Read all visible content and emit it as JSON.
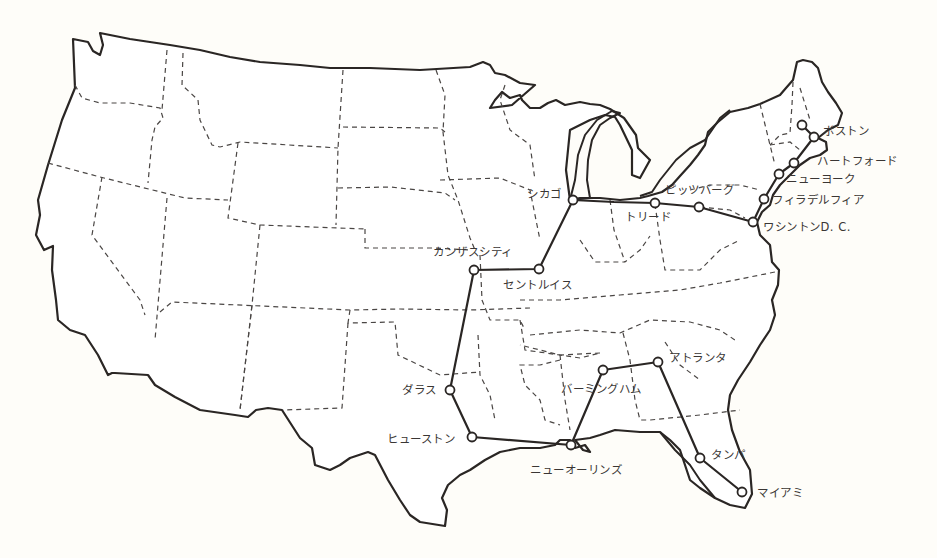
{
  "map": {
    "title": "",
    "cities": [
      {
        "id": "boston",
        "label": "ボストン",
        "x": 814,
        "y": 137
      },
      {
        "id": "boston-north",
        "label": "",
        "x": 802,
        "y": 125
      },
      {
        "id": "hartford",
        "label": "ハートフォード",
        "x": 794,
        "y": 163
      },
      {
        "id": "new-york",
        "label": "ニューヨーク",
        "x": 779,
        "y": 174
      },
      {
        "id": "philadelphia",
        "label": "フィラデルフィア",
        "x": 764,
        "y": 199
      },
      {
        "id": "washington-dc",
        "label": "ワシントンD. C.",
        "x": 753,
        "y": 222
      },
      {
        "id": "pittsburgh-east",
        "label": "",
        "x": 699,
        "y": 207
      },
      {
        "id": "pittsburgh",
        "label": "ピッツバーグ",
        "x": 655,
        "y": 203
      },
      {
        "id": "toledo",
        "label": "トリード",
        "x": 614,
        "y": 202
      },
      {
        "id": "chicago",
        "label": "シカゴ",
        "x": 573,
        "y": 200
      },
      {
        "id": "st-louis",
        "label": "セントルイス",
        "x": 539,
        "y": 269
      },
      {
        "id": "kansas-city",
        "label": "カンザスシティ",
        "x": 474,
        "y": 270
      },
      {
        "id": "dallas",
        "label": "ダラス",
        "x": 450,
        "y": 390
      },
      {
        "id": "houston",
        "label": "ヒューストン",
        "x": 472,
        "y": 437
      },
      {
        "id": "new-orleans",
        "label": "ニューオーリンズ",
        "x": 571,
        "y": 445
      },
      {
        "id": "birmingham",
        "label": "バーミングハム",
        "x": 603,
        "y": 370
      },
      {
        "id": "atlanta",
        "label": "アトランタ",
        "x": 658,
        "y": 362
      },
      {
        "id": "tampa",
        "label": "タンパ",
        "x": 700,
        "y": 458
      },
      {
        "id": "miami",
        "label": "マイアミ",
        "x": 742,
        "y": 492
      }
    ],
    "labels": {
      "boston": "ボストン",
      "hartford": "ハートフォード",
      "new_york": "ニューヨーク",
      "philadelphia": "フィラデルフィア",
      "washington_dc": "ワシントンD. C.",
      "pittsburgh": "ピッツバーグ",
      "toledo": "トリード",
      "chicago": "シカゴ",
      "st_louis": "セントルイス",
      "kansas_city": "カンザスシティ",
      "dallas": "ダラス",
      "houston": "ヒューストン",
      "new_orleans": "ニューオーリンズ",
      "birmingham": "バーミングハム",
      "atlanta": "アトランタ",
      "tampa": "タンパ",
      "miami": "マイアミ"
    },
    "colors": {
      "background": "#fefdf9",
      "land": "#ffffff",
      "line": "#2a2624",
      "text": "#3a3634"
    }
  }
}
